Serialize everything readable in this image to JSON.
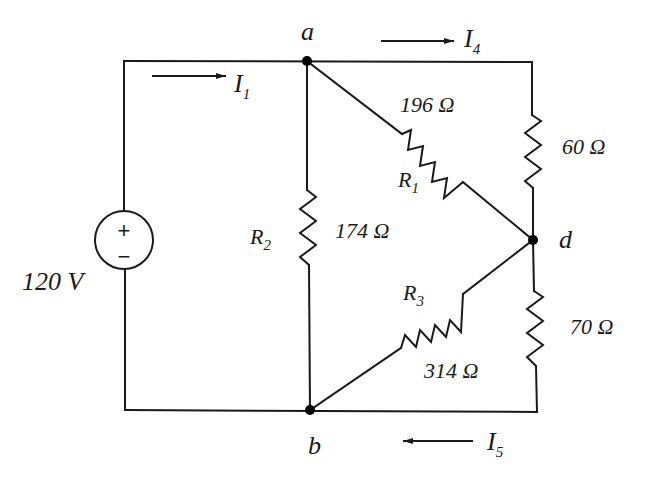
{
  "diagram": {
    "type": "circuit-schematic",
    "source": {
      "label": "120 V",
      "polarity_plus": "+",
      "polarity_minus": "−"
    },
    "nodes": {
      "a": {
        "label": "a"
      },
      "b": {
        "label": "b"
      },
      "d": {
        "label": "d"
      }
    },
    "currents": {
      "I1": {
        "main": "I",
        "sub": "1",
        "direction": "right"
      },
      "I4": {
        "main": "I",
        "sub": "4",
        "direction": "right"
      },
      "I5": {
        "main": "I",
        "sub": "5",
        "direction": "left"
      }
    },
    "resistors": {
      "R1": {
        "name_main": "R",
        "name_sub": "1",
        "value": "196 Ω",
        "between": "a-d"
      },
      "R2": {
        "name_main": "R",
        "name_sub": "2",
        "value": "174 Ω",
        "between": "a-b"
      },
      "R3": {
        "name_main": "R",
        "name_sub": "3",
        "value": "314 Ω",
        "between": "b-d"
      },
      "R60": {
        "value": "60 Ω",
        "between": "top-right-d"
      },
      "R70": {
        "value": "70 Ω",
        "between": "d-bottom-right"
      }
    },
    "colors": {
      "ink": "#1a1a1a",
      "background": "#ffffff"
    }
  }
}
